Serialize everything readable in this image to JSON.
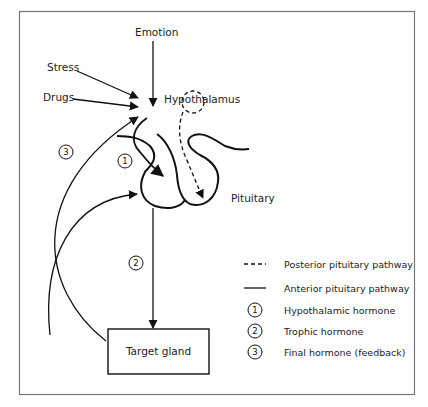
{
  "diagram": {
    "labels": {
      "emotion": "Emotion",
      "stress": "Stress",
      "drugs": "Drugs",
      "hypothalamus": "Hypothalamus",
      "pituitary": "Pituitary",
      "target_gland": "Target gland"
    },
    "markers": {
      "one": "1",
      "two": "2",
      "three": "3"
    }
  },
  "legend": {
    "items": [
      {
        "symbol": "dashed-line",
        "label": "Posterior pituitary pathway"
      },
      {
        "symbol": "solid-line",
        "label": "Anterior pituitary pathway"
      },
      {
        "symbol": "circle-1",
        "num": "1",
        "label": "Hypothalamic hormone"
      },
      {
        "symbol": "circle-2",
        "num": "2",
        "label": "Trophic hormone"
      },
      {
        "symbol": "circle-3",
        "num": "3",
        "label": "Final hormone (feedback)"
      }
    ]
  }
}
